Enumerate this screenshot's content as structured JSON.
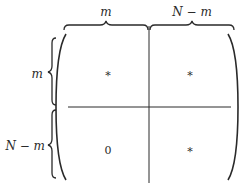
{
  "column_labels": [
    "m",
    "N − m"
  ],
  "row_labels": [
    "m",
    "N − m"
  ],
  "cells": [
    [
      "*",
      "*"
    ],
    [
      "0",
      "*"
    ]
  ],
  "colors": {
    "ink": "#2a2a2a",
    "background": "#ffffff"
  }
}
